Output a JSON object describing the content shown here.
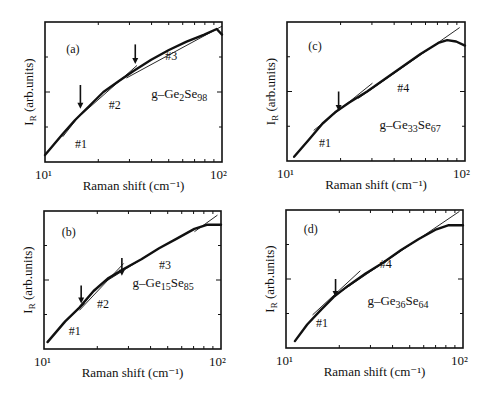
{
  "figure": {
    "panels_layout": [
      [
        "a",
        "c"
      ],
      [
        "b",
        "d"
      ]
    ]
  },
  "chart_data": [
    {
      "id": "a",
      "type": "line",
      "panel_label": "(a)",
      "sample": "g-Ge2Se98",
      "sample_parts": {
        "prefix": "g–Ge",
        "n1": "2",
        "mid": "Se",
        "n2": "98"
      },
      "xlabel": "Raman shift (cm⁻¹)",
      "ylabel": "I_R (arb.units)",
      "xscale": "log",
      "xlim": [
        10,
        100
      ],
      "xticks": [
        "10¹",
        "10²"
      ],
      "frame": {
        "x": 45,
        "y": 22,
        "w": 177,
        "h": 140
      },
      "curve": [
        [
          0.0,
          0.05
        ],
        [
          0.1,
          0.2
        ],
        [
          0.17,
          0.3
        ],
        [
          0.25,
          0.4
        ],
        [
          0.33,
          0.5
        ],
        [
          0.42,
          0.58
        ],
        [
          0.5,
          0.65
        ],
        [
          0.6,
          0.73
        ],
        [
          0.7,
          0.8
        ],
        [
          0.8,
          0.86
        ],
        [
          0.9,
          0.91
        ],
        [
          0.97,
          0.95
        ],
        [
          1.0,
          0.91
        ]
      ],
      "fits": [
        {
          "label": "#1",
          "from": [
            0.1,
            0.18
          ],
          "to": [
            0.2,
            0.34
          ],
          "label_pos": [
            0.17,
            0.1
          ]
        },
        {
          "label": "#2",
          "from": [
            0.18,
            0.31
          ],
          "to": [
            0.52,
            0.69
          ],
          "label_pos": [
            0.36,
            0.38
          ],
          "dashed_gap": [
            0.29,
            0.37
          ]
        },
        {
          "label": "#3",
          "from": [
            0.46,
            0.6
          ],
          "to": [
            1.0,
            0.97
          ],
          "label_pos": [
            0.68,
            0.73
          ]
        }
      ],
      "arrows": [
        {
          "u": 0.2,
          "v_top": 0.55,
          "v_bot": 0.38
        },
        {
          "u": 0.51,
          "v_top": 0.84,
          "v_bot": 0.7
        }
      ],
      "label_pos": {
        "panel": [
          0.12,
          0.78
        ],
        "sample": [
          0.6,
          0.46
        ]
      }
    },
    {
      "id": "c",
      "type": "line",
      "panel_label": "(c)",
      "sample": "g-Ge33Se67",
      "sample_parts": {
        "prefix": "g–Ge",
        "n1": "33",
        "mid": "Se",
        "n2": "67"
      },
      "xlabel": "Raman shift (cm⁻¹)",
      "ylabel": "I_R (arb.units)",
      "xscale": "log",
      "xlim": [
        10,
        100
      ],
      "xticks": [
        "10¹",
        "10²"
      ],
      "frame": {
        "x": 287,
        "y": 22,
        "w": 178,
        "h": 139
      },
      "curve": [
        [
          0.04,
          0.03
        ],
        [
          0.12,
          0.15
        ],
        [
          0.2,
          0.27
        ],
        [
          0.27,
          0.35
        ],
        [
          0.35,
          0.42
        ],
        [
          0.45,
          0.5
        ],
        [
          0.55,
          0.59
        ],
        [
          0.65,
          0.68
        ],
        [
          0.75,
          0.77
        ],
        [
          0.85,
          0.85
        ],
        [
          0.9,
          0.87
        ],
        [
          0.95,
          0.86
        ],
        [
          1.0,
          0.83
        ]
      ],
      "fits": [
        {
          "label": "#1",
          "from": [
            0.15,
            0.22
          ],
          "to": [
            0.48,
            0.56
          ],
          "label_pos": [
            0.18,
            0.1
          ]
        },
        {
          "label": "#4",
          "from": [
            0.4,
            0.45
          ],
          "to": [
            0.97,
            0.96
          ],
          "label_pos": [
            0.62,
            0.5
          ]
        }
      ],
      "arrows": [
        {
          "u": 0.29,
          "v_top": 0.5,
          "v_bot": 0.36
        }
      ],
      "label_pos": {
        "panel": [
          0.12,
          0.8
        ],
        "sample": [
          0.52,
          0.23
        ]
      }
    },
    {
      "id": "b",
      "type": "line",
      "panel_label": "(b)",
      "sample": "g-Ge15Se85",
      "sample_parts": {
        "prefix": "g–Ge",
        "n1": "15",
        "mid": "Se",
        "n2": "85"
      },
      "xlabel": "Raman shift (cm⁻¹)",
      "ylabel": "I_R (arb.units)",
      "xscale": "log",
      "xlim": [
        10,
        100
      ],
      "xticks": [
        "10¹",
        "10²"
      ],
      "frame": {
        "x": 44,
        "y": 211,
        "w": 177,
        "h": 138
      },
      "curve": [
        [
          0.02,
          0.05
        ],
        [
          0.12,
          0.2
        ],
        [
          0.2,
          0.3
        ],
        [
          0.28,
          0.42
        ],
        [
          0.36,
          0.51
        ],
        [
          0.45,
          0.58
        ],
        [
          0.55,
          0.65
        ],
        [
          0.65,
          0.73
        ],
        [
          0.75,
          0.8
        ],
        [
          0.85,
          0.87
        ],
        [
          0.92,
          0.9
        ],
        [
          1.0,
          0.9
        ]
      ],
      "fits": [
        {
          "label": "#1",
          "from": [
            0.1,
            0.18
          ],
          "to": [
            0.23,
            0.33
          ],
          "label_pos": [
            0.14,
            0.1
          ]
        },
        {
          "label": "#2",
          "from": [
            0.2,
            0.28
          ],
          "to": [
            0.45,
            0.62
          ],
          "label_pos": [
            0.3,
            0.3
          ]
        },
        {
          "label": "#3",
          "from": [
            0.35,
            0.49
          ],
          "to": [
            0.65,
            0.73
          ],
          "label_pos": [
            0.65,
            0.58
          ]
        },
        {
          "label": "",
          "from": [
            0.85,
            0.85
          ],
          "to": [
            0.98,
            0.97
          ],
          "label_pos": [
            0,
            0
          ]
        }
      ],
      "arrows": [
        {
          "u": 0.21,
          "v_top": 0.46,
          "v_bot": 0.33
        },
        {
          "u": 0.44,
          "v_top": 0.66,
          "v_bot": 0.53
        }
      ],
      "label_pos": {
        "panel": [
          0.1,
          0.82
        ],
        "sample": [
          0.5,
          0.45
        ]
      }
    },
    {
      "id": "d",
      "type": "line",
      "panel_label": "(d)",
      "sample": "g-Ge36Se64",
      "sample_parts": {
        "prefix": "g–Ge",
        "n1": "36",
        "mid": "Se",
        "n2": "64"
      },
      "xlabel": "Raman shift (cm⁻¹)",
      "ylabel": "I_R (arb.units)",
      "xscale": "log",
      "xlim": [
        10,
        100
      ],
      "xticks": [
        "10¹",
        "10²"
      ],
      "frame": {
        "x": 286,
        "y": 210,
        "w": 177,
        "h": 138
      },
      "curve": [
        [
          0.05,
          0.05
        ],
        [
          0.12,
          0.17
        ],
        [
          0.2,
          0.28
        ],
        [
          0.27,
          0.37
        ],
        [
          0.35,
          0.45
        ],
        [
          0.45,
          0.54
        ],
        [
          0.55,
          0.62
        ],
        [
          0.65,
          0.71
        ],
        [
          0.75,
          0.79
        ],
        [
          0.85,
          0.86
        ],
        [
          0.92,
          0.89
        ],
        [
          1.0,
          0.89
        ]
      ],
      "fits": [
        {
          "label": "#1",
          "from": [
            0.15,
            0.24
          ],
          "to": [
            0.42,
            0.56
          ],
          "label_pos": [
            0.17,
            0.15
          ]
        },
        {
          "label": "#4",
          "from": [
            0.3,
            0.4
          ],
          "to": [
            0.98,
            0.99
          ],
          "label_pos": [
            0.53,
            0.58
          ]
        }
      ],
      "arrows": [
        {
          "u": 0.28,
          "v_top": 0.5,
          "v_bot": 0.37
        }
      ],
      "label_pos": {
        "panel": [
          0.1,
          0.83
        ],
        "sample": [
          0.46,
          0.31
        ]
      }
    }
  ]
}
